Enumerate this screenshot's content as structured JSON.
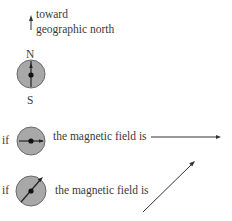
{
  "header": {
    "line1": "toward",
    "line2": "geographic north"
  },
  "compass_reference": {
    "north_label": "N",
    "south_label": "S"
  },
  "examples": [
    {
      "prefix": "if",
      "text": "the magnetic field is",
      "needle_direction": "east",
      "field_arrow": "horizontal-right"
    },
    {
      "prefix": "if",
      "text": "the magnetic field is",
      "needle_direction": "northeast",
      "field_arrow": "diagonal-up-right"
    }
  ],
  "colors": {
    "compass_fill": "#a8a8a8",
    "compass_stroke": "#6a6a6a",
    "ink": "#333333"
  }
}
